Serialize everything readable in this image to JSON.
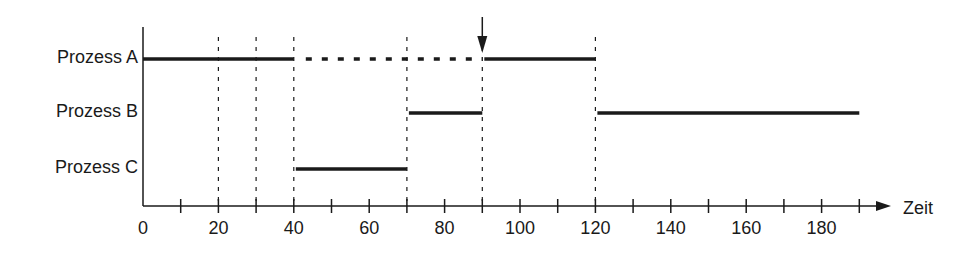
{
  "diagram": {
    "type": "process-scheduling-timeline",
    "processes": [
      {
        "label": "Prozess A",
        "y": 59
      },
      {
        "label": "Prozess B",
        "y": 113
      },
      {
        "label": "Prozess C",
        "y": 169
      }
    ],
    "axis": {
      "title": "Zeit",
      "min": 0,
      "max": 190,
      "tick_step": 10,
      "labels": [
        "0",
        "20",
        "40",
        "60",
        "80",
        "100",
        "120",
        "140",
        "160",
        "180"
      ]
    },
    "segments": [
      {
        "process": "Prozess A",
        "start": 0,
        "end": 40,
        "style": "solid"
      },
      {
        "process": "Prozess A",
        "start": 40,
        "end": 90,
        "style": "dotted"
      },
      {
        "process": "Prozess A",
        "start": 90,
        "end": 120,
        "style": "solid"
      },
      {
        "process": "Prozess B",
        "start": 70,
        "end": 90,
        "style": "solid"
      },
      {
        "process": "Prozess B",
        "start": 120,
        "end": 190,
        "style": "solid"
      },
      {
        "process": "Prozess C",
        "start": 40,
        "end": 70,
        "style": "solid"
      }
    ],
    "dashed_markers": [
      20,
      30,
      40,
      70,
      90,
      120
    ],
    "event_arrow": {
      "at": 90
    },
    "colors": {
      "line": "#1a1a1a",
      "background": "#ffffff"
    }
  }
}
